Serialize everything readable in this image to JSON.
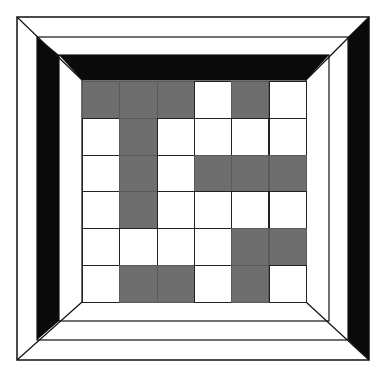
{
  "diagram": {
    "title": "",
    "colors": {
      "background": "#ffffff",
      "line": "#111111",
      "black_band": "#0a0a0a",
      "tile_fill": "#6e6e6e",
      "tile_empty": "#ffffff"
    },
    "frame": {
      "outer": {
        "x": 17,
        "y": 17,
        "w": 352,
        "h": 343
      },
      "second": {
        "x": 37,
        "y": 37,
        "w": 311,
        "h": 303
      },
      "third": {
        "x": 59,
        "y": 55,
        "w": 270,
        "h": 266
      },
      "inner": {
        "x": 82,
        "y": 80,
        "w": 224,
        "h": 222
      }
    },
    "grid": {
      "rows": 6,
      "cols": 6,
      "x": 82,
      "y": 81,
      "cell_w": 37.3,
      "cell_h": 36.8,
      "filled": [
        [
          1,
          1,
          1,
          0,
          1,
          0
        ],
        [
          0,
          1,
          0,
          0,
          0,
          0
        ],
        [
          0,
          1,
          0,
          1,
          1,
          1
        ],
        [
          0,
          1,
          0,
          0,
          0,
          0
        ],
        [
          0,
          0,
          0,
          0,
          1,
          1
        ],
        [
          0,
          1,
          1,
          0,
          1,
          0
        ]
      ]
    }
  }
}
